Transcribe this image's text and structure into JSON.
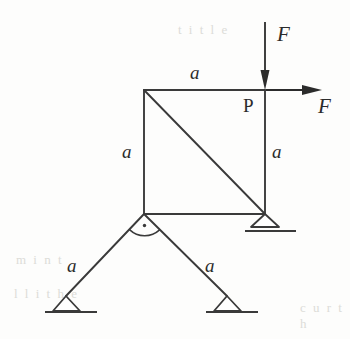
{
  "figure": {
    "stroke_color": "#3a3a3a",
    "background_color": "#fdfdfc",
    "label_color": "#2b2b2b",
    "width": 350,
    "height": 339
  },
  "dimension_labels": {
    "top_side": "a",
    "left_side": "a",
    "right_side": "a",
    "left_leg": "a",
    "right_leg": "a"
  },
  "load_labels": {
    "vertical_force": "F",
    "horizontal_force": "F"
  },
  "point_labels": {
    "joint_p": "P"
  },
  "icons": {
    "vertical_arrow": "down-arrow-icon",
    "horizontal_arrow": "right-arrow-icon",
    "right_angle": "right-angle-marker-icon",
    "support_right": "roller-support-icon",
    "support_bottom_left": "pin-support-icon",
    "support_bottom_right": "pin-support-icon"
  },
  "geometry": {
    "square": {
      "x1": 144,
      "y1": 90,
      "x2": 265,
      "y2": 214
    },
    "diagonal": {
      "x1": 144,
      "y1": 90,
      "x2": 265,
      "y2": 214
    },
    "apex": {
      "x": 144,
      "y": 214
    },
    "left_foot": {
      "x": 66,
      "y": 296
    },
    "right_foot": {
      "x": 227,
      "y": 296
    },
    "vertical_arrow": {
      "x": 265,
      "y_start": 22,
      "y_end": 88
    },
    "horizontal_arrow": {
      "y": 90,
      "x_start": 265,
      "x_end": 320
    }
  },
  "ghost_text": {
    "row1": "t i t l e",
    "row2": "m i n t",
    "row3": "l l i t h e",
    "row4": "c u  r   t h"
  }
}
